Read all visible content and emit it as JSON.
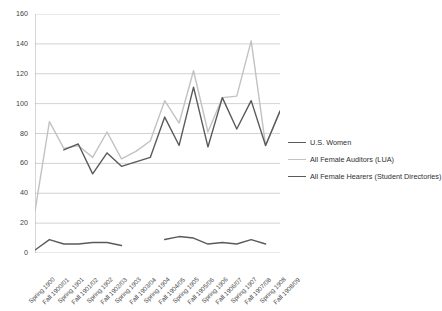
{
  "chart_data": {
    "type": "line",
    "title": "",
    "subtitle": "",
    "xlabel": "",
    "ylabel": "",
    "ylim": [
      0,
      160
    ],
    "yticks": [
      0,
      20,
      40,
      60,
      80,
      100,
      120,
      140,
      160
    ],
    "grid": true,
    "legend_position": "right",
    "categories": [
      "Spring 1900",
      "Fall 1900/01",
      "Spring 1901",
      "Fall 1901/02",
      "Spring 1902",
      "Fall 1902/03",
      "Spring 1903",
      "Fall 1903/04",
      "Spring 1904",
      "Fall 1904/05",
      "Spring 1905",
      "Fall 1905/06",
      "Spring 1906",
      "Fall 1906/07",
      "Spring 1907",
      "Fall 1907/08",
      "Spring 1908",
      "Fall 1908/09"
    ],
    "series": [
      {
        "name": "U.S. Women",
        "color": "#5a5a5a",
        "width": 1.4,
        "values": [
          2,
          9,
          6,
          6,
          7,
          7,
          5,
          null,
          null,
          9,
          11,
          10,
          6,
          7,
          6,
          9,
          6,
          null
        ]
      },
      {
        "name": "All Female Auditors (LUA)",
        "color": "#c2c2c2",
        "width": 1.4,
        "values": [
          28,
          88,
          70,
          72,
          64,
          81,
          63,
          68,
          75,
          102,
          87,
          122,
          81,
          104,
          105,
          142,
          72,
          95
        ]
      },
      {
        "name": "All Female Hearers (Student Directories)",
        "color": "#5a5a5a",
        "width": 1.4,
        "values": [
          null,
          null,
          69,
          73,
          53,
          67,
          58,
          61,
          64,
          91,
          72,
          111,
          71,
          104,
          83,
          102,
          72,
          95
        ]
      }
    ]
  },
  "legend": {
    "items": [
      {
        "label": "U.S. Women",
        "color": "#5a5a5a"
      },
      {
        "label": "All Female Auditors (LUA)",
        "color": "#c2c2c2"
      },
      {
        "label": "All Female Hearers (Student Directories)",
        "color": "#5a5a5a"
      }
    ]
  },
  "axes": {
    "y_ticks": [
      "0",
      "20",
      "40",
      "60",
      "80",
      "100",
      "120",
      "140",
      "160"
    ],
    "x_ticks": [
      "Spring 1900",
      "Fall 1900/01",
      "Spring 1901",
      "Fall 1901/02",
      "Spring 1902",
      "Fall 1902/03",
      "Spring 1903",
      "Fall 1903/04",
      "Spring 1904",
      "Fall 1904/05",
      "Spring 1905",
      "Fall 1905/06",
      "Spring 1906",
      "Fall 1906/07",
      "Spring 1907",
      "Fall 1907/08",
      "Spring 1908",
      "Fall 1908/09"
    ]
  }
}
